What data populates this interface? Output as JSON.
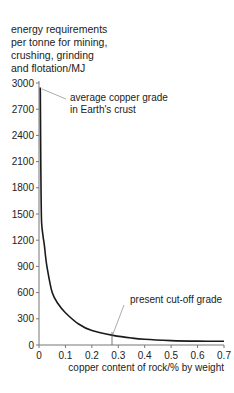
{
  "chart_data": {
    "type": "line",
    "title": "",
    "ylabel": "energy requirements per tonne for mining, crushing, grinding and flotation/MJ",
    "xlabel": "copper content of rock/% by weight",
    "xlim": [
      0,
      0.7
    ],
    "ylim": [
      0,
      3000
    ],
    "x_ticks": [
      "0",
      "0.1",
      "0.2",
      "0.3",
      "0.4",
      "0.5",
      "0.6",
      "0.7"
    ],
    "y_ticks": [
      "0",
      "300",
      "600",
      "900",
      "1200",
      "1500",
      "1800",
      "2100",
      "2400",
      "2700",
      "3000"
    ],
    "grid": false,
    "series": [
      {
        "name": "energy requirement",
        "x": [
          0.005,
          0.006,
          0.008,
          0.01,
          0.015,
          0.02,
          0.03,
          0.05,
          0.075,
          0.1,
          0.15,
          0.2,
          0.28,
          0.35,
          0.4,
          0.5,
          0.6,
          0.7
        ],
        "y": [
          2950,
          2400,
          1700,
          1400,
          1250,
          1150,
          900,
          600,
          460,
          370,
          240,
          165,
          110,
          80,
          65,
          50,
          45,
          42
        ]
      }
    ],
    "annotations": [
      {
        "text": "average copper grade in Earth's crust",
        "x": 0.005,
        "y": 2900
      },
      {
        "text": "present cut-off grade",
        "x": 0.28,
        "y": 110
      }
    ]
  },
  "labels": {
    "ylabel": "energy requirements\nper tonne for mining,\ncrushing, grinding\nand flotation/MJ",
    "xlabel": "copper content of rock/% by weight",
    "anno_crust_line1": "average copper grade",
    "anno_crust_line2": "in Earth's crust",
    "anno_cutoff": "present cut-off grade"
  }
}
